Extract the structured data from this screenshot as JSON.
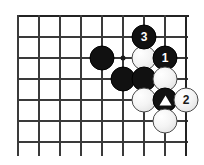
{
  "diagram": {
    "kind": "go-board-diagram",
    "board": {
      "cell_size": 21,
      "origin_x": 18,
      "origin_y": 16,
      "columns": 9,
      "rows": 7,
      "edges": [
        "top",
        "right"
      ],
      "line_color": "#3a3a3a",
      "edge_color": "#232323",
      "background_color": "#ffffff"
    },
    "star_points": [
      {
        "name": "hoshi",
        "col": 5,
        "row": 2
      }
    ],
    "stones": [
      {
        "name": "black-stone-left",
        "color": "black",
        "col": 4,
        "row": 2,
        "label": "",
        "mark": ""
      },
      {
        "name": "white-stone-upper",
        "color": "white",
        "col": 6,
        "row": 2,
        "label": "",
        "mark": ""
      },
      {
        "name": "black-move-3",
        "color": "black",
        "col": 6,
        "row": 1,
        "label": "3",
        "mark": ""
      },
      {
        "name": "black-move-1",
        "color": "black",
        "col": 7,
        "row": 2,
        "label": "1",
        "mark": ""
      },
      {
        "name": "black-stone-lower-left",
        "color": "black",
        "col": 5,
        "row": 3,
        "label": "",
        "mark": ""
      },
      {
        "name": "black-stone-lower-mid",
        "color": "black",
        "col": 6,
        "row": 3,
        "label": "",
        "mark": ""
      },
      {
        "name": "white-stone-right",
        "color": "white",
        "col": 7,
        "row": 3,
        "label": "",
        "mark": ""
      },
      {
        "name": "white-stone-bottom-left",
        "color": "white",
        "col": 6,
        "row": 4,
        "label": "",
        "mark": ""
      },
      {
        "name": "black-stone-triangle",
        "color": "black",
        "col": 7,
        "row": 4,
        "label": "",
        "mark": "triangle"
      },
      {
        "name": "white-move-2",
        "color": "white",
        "col": 8,
        "row": 4,
        "label": "2",
        "mark": ""
      },
      {
        "name": "white-stone-bottom",
        "color": "white",
        "col": 7,
        "row": 5,
        "label": "",
        "mark": ""
      }
    ]
  }
}
